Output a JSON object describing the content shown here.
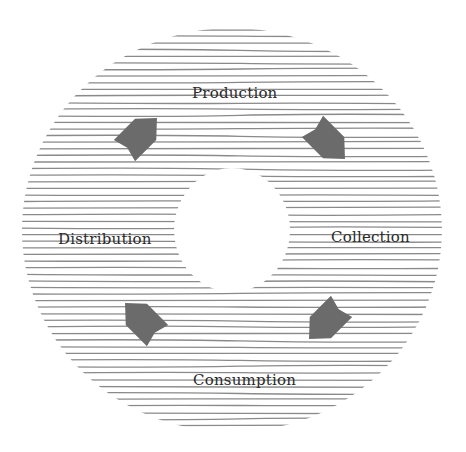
{
  "diagram": {
    "type": "cycle",
    "nodes": [
      {
        "id": "production",
        "label": "Production",
        "x": 192,
        "y": 86
      },
      {
        "id": "collection",
        "label": "Collection",
        "x": 331,
        "y": 230
      },
      {
        "id": "consumption",
        "label": "Consumption",
        "x": 193,
        "y": 373
      },
      {
        "id": "distribution",
        "label": "Distribution",
        "x": 58,
        "y": 232
      }
    ],
    "edges": [
      {
        "from": "production",
        "to": "collection"
      },
      {
        "from": "collection",
        "to": "consumption"
      },
      {
        "from": "consumption",
        "to": "distribution"
      },
      {
        "from": "distribution",
        "to": "production"
      }
    ],
    "colors": {
      "hatch": "#8a8a8a",
      "arrow": "#6b6b6b",
      "text": "#2a2a2a",
      "background": "#ffffff"
    }
  }
}
